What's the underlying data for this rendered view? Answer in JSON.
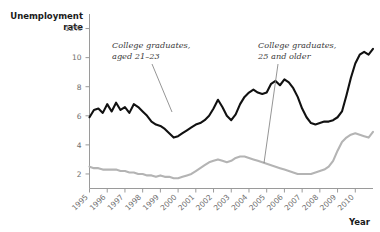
{
  "chart_data": {
    "type": "line",
    "title": "Unemployment rate",
    "xlabel": "Year",
    "ylabel": "Unemployment rate",
    "ylim": [
      1,
      13
    ],
    "xlim": [
      1995,
      2011
    ],
    "yticks": [
      "2",
      "4",
      "6",
      "8",
      "10",
      "12%"
    ],
    "ytick_values": [
      2,
      4,
      6,
      8,
      10,
      12
    ],
    "xticks": [
      "1995",
      "1996",
      "1997",
      "1998",
      "1999",
      "2000",
      "2001",
      "2002",
      "2003",
      "2004",
      "2005",
      "2006",
      "2007",
      "2008",
      "2009",
      "2010"
    ],
    "grid": false,
    "legend_position": "inline-annotations",
    "annotations": [
      {
        "name": "annotation-college-grads-21-23",
        "line1": "College graduates,",
        "line2": "aged 21–23",
        "series": "College graduates, aged 21-23"
      },
      {
        "name": "annotation-college-grads-25-older",
        "line1": "College graduates,",
        "line2": "25 and older",
        "series": "College graduates, 25 and older"
      }
    ],
    "colors": {
      "series_dark": "#111111",
      "series_gray": "#b4b4b4",
      "axis": "#9a9a9a",
      "tick_text": "#6e6e6e",
      "title_text": "#1a1a1a"
    },
    "series": [
      {
        "name": "College graduates, aged 21-23",
        "color": "#111111",
        "x": [
          1995.0,
          1995.25,
          1995.5,
          1995.75,
          1996.0,
          1996.25,
          1996.5,
          1996.75,
          1997.0,
          1997.25,
          1997.5,
          1997.75,
          1998.0,
          1998.25,
          1998.5,
          1998.75,
          1999.0,
          1999.25,
          1999.5,
          1999.75,
          2000.0,
          2000.25,
          2000.5,
          2000.75,
          2001.0,
          2001.25,
          2001.5,
          2001.75,
          2002.0,
          2002.25,
          2002.5,
          2002.75,
          2003.0,
          2003.25,
          2003.5,
          2003.75,
          2004.0,
          2004.25,
          2004.5,
          2004.75,
          2005.0,
          2005.25,
          2005.5,
          2005.75,
          2006.0,
          2006.25,
          2006.5,
          2006.75,
          2007.0,
          2007.25,
          2007.5,
          2007.75,
          2008.0,
          2008.25,
          2008.5,
          2008.75,
          2009.0,
          2009.25,
          2009.5,
          2009.75,
          2010.0,
          2010.25,
          2010.5,
          2010.75,
          2011.0
        ],
        "values": [
          5.9,
          6.4,
          6.5,
          6.2,
          6.8,
          6.3,
          6.9,
          6.4,
          6.6,
          6.2,
          6.8,
          6.6,
          6.3,
          6.0,
          5.6,
          5.4,
          5.3,
          5.1,
          4.8,
          4.5,
          4.6,
          4.8,
          5.0,
          5.2,
          5.4,
          5.5,
          5.7,
          6.0,
          6.5,
          7.1,
          6.6,
          6.0,
          5.7,
          6.1,
          6.8,
          7.3,
          7.6,
          7.8,
          7.6,
          7.5,
          7.6,
          8.2,
          8.4,
          8.1,
          8.5,
          8.3,
          7.9,
          7.3,
          6.5,
          5.9,
          5.5,
          5.4,
          5.5,
          5.6,
          5.6,
          5.7,
          5.9,
          6.3,
          7.4,
          8.6,
          9.6,
          10.2,
          10.4,
          10.2,
          10.6
        ]
      },
      {
        "name": "College graduates, 25 and older",
        "color": "#b4b4b4",
        "x": [
          1995.0,
          1995.25,
          1995.5,
          1995.75,
          1996.0,
          1996.25,
          1996.5,
          1996.75,
          1997.0,
          1997.25,
          1997.5,
          1997.75,
          1998.0,
          1998.25,
          1998.5,
          1998.75,
          1999.0,
          1999.25,
          1999.5,
          1999.75,
          2000.0,
          2000.25,
          2000.5,
          2000.75,
          2001.0,
          2001.25,
          2001.5,
          2001.75,
          2002.0,
          2002.25,
          2002.5,
          2002.75,
          2003.0,
          2003.25,
          2003.5,
          2003.75,
          2004.0,
          2004.25,
          2004.5,
          2004.75,
          2005.0,
          2005.25,
          2005.5,
          2005.75,
          2006.0,
          2006.25,
          2006.5,
          2006.75,
          2007.0,
          2007.25,
          2007.5,
          2007.75,
          2008.0,
          2008.25,
          2008.5,
          2008.75,
          2009.0,
          2009.25,
          2009.5,
          2009.75,
          2010.0,
          2010.25,
          2010.5,
          2010.75,
          2011.0
        ],
        "values": [
          2.5,
          2.4,
          2.4,
          2.3,
          2.3,
          2.3,
          2.3,
          2.2,
          2.2,
          2.1,
          2.1,
          2.0,
          2.0,
          1.9,
          1.9,
          1.8,
          1.9,
          1.8,
          1.8,
          1.7,
          1.7,
          1.8,
          1.9,
          2.0,
          2.2,
          2.4,
          2.6,
          2.8,
          2.9,
          3.0,
          2.9,
          2.8,
          2.9,
          3.1,
          3.2,
          3.2,
          3.1,
          3.0,
          2.9,
          2.8,
          2.7,
          2.6,
          2.5,
          2.4,
          2.3,
          2.2,
          2.1,
          2.0,
          2.0,
          2.0,
          2.0,
          2.1,
          2.2,
          2.3,
          2.5,
          2.9,
          3.6,
          4.2,
          4.5,
          4.7,
          4.8,
          4.7,
          4.6,
          4.5,
          4.9
        ]
      }
    ]
  },
  "labels": {
    "y_axis_title_line1": "Unemployment",
    "y_axis_title_line2": "rate",
    "x_axis_title": "Year"
  }
}
